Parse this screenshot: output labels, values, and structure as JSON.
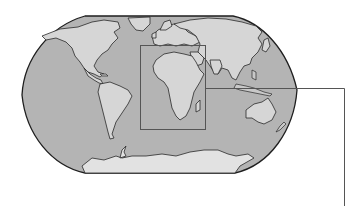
{
  "map": {
    "projection": "robinson-like world map",
    "style": "grayscale shaded relief",
    "colors": {
      "ocean": "#b4b4b4",
      "land": "#d6d6d6",
      "outline": "#1e1e1e",
      "highlight_frame": "#555555"
    },
    "highlight_region": {
      "name": "Africa",
      "frame_px": {
        "x": 140,
        "y": 45,
        "width": 65,
        "height": 84
      }
    },
    "callout_line": {
      "points_px": [
        [
          205,
          88
        ],
        [
          344,
          88
        ],
        [
          344,
          206
        ]
      ]
    }
  }
}
